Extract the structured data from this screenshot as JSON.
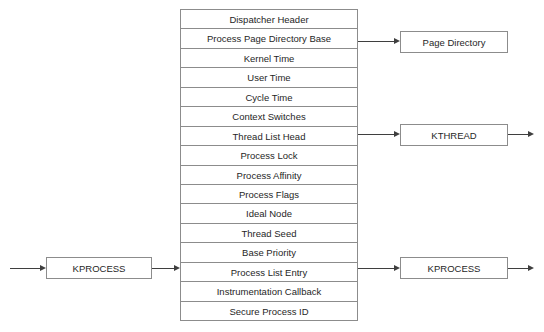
{
  "diagram": {
    "colors": {
      "border": "#8c8c8c",
      "connector": "#3f3f3f",
      "text": "#262626",
      "background": "#ffffff"
    },
    "struct_table": {
      "name": "KPROCESS fields",
      "rows": [
        {
          "label": "Dispatcher Header"
        },
        {
          "label": "Process Page Directory Base"
        },
        {
          "label": "Kernel Time"
        },
        {
          "label": "User Time"
        },
        {
          "label": "Cycle Time"
        },
        {
          "label": "Context Switches"
        },
        {
          "label": "Thread List Head"
        },
        {
          "label": "Process Lock"
        },
        {
          "label": "Process Affinity"
        },
        {
          "label": "Process Flags"
        },
        {
          "label": "Ideal Node"
        },
        {
          "label": "Thread Seed"
        },
        {
          "label": "Base Priority"
        },
        {
          "label": "Process List Entry"
        },
        {
          "label": "Instrumentation Callback"
        },
        {
          "label": "Secure Process ID"
        }
      ]
    },
    "nodes": {
      "left_kprocess": {
        "label": "KPROCESS"
      },
      "page_directory": {
        "label": "Page Directory"
      },
      "kthread": {
        "label": "KTHREAD"
      },
      "right_kprocess": {
        "label": "KPROCESS"
      }
    },
    "connectors": [
      {
        "name": "incoming-to-left-kprocess",
        "from": "edge",
        "to": "left_kprocess"
      },
      {
        "name": "left-kprocess-to-process-list-entry",
        "from": "left_kprocess",
        "to": "Process List Entry"
      },
      {
        "name": "process-page-directory-base-to-page-directory",
        "from": "Process Page Directory Base",
        "to": "page_directory"
      },
      {
        "name": "thread-list-head-to-kthread",
        "from": "Thread List Head",
        "to": "kthread"
      },
      {
        "name": "kthread-to-edge",
        "from": "kthread",
        "to": "edge"
      },
      {
        "name": "process-list-entry-to-right-kprocess",
        "from": "Process List Entry",
        "to": "right_kprocess"
      },
      {
        "name": "right-kprocess-to-edge",
        "from": "right_kprocess",
        "to": "edge"
      }
    ]
  }
}
